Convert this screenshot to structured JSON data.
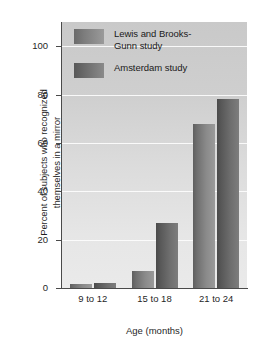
{
  "chart_data": {
    "type": "bar",
    "title": "",
    "subtitle": "",
    "xlabel": "Age (months)",
    "ylabel": "Percent of subjects who recognized\nthemselves in a mirror",
    "categories": [
      "9 to 12",
      "15 to 18",
      "21 to 24"
    ],
    "series": [
      {
        "name": "Lewis and Brooks-\nGunn study",
        "values": [
          1.5,
          7,
          68
        ]
      },
      {
        "name": "Amsterdam study",
        "values": [
          2,
          27,
          78
        ]
      }
    ],
    "ylim": [
      0,
      110
    ],
    "yticks": [
      0,
      20,
      40,
      60,
      80,
      100
    ],
    "ytick_labels": [
      "0",
      "20",
      "40",
      "60",
      "80",
      "100"
    ],
    "grid": true,
    "grid_color": "#fdfdfd",
    "legend_position": "upper-left-inside",
    "plot_background": "#d6d6d6",
    "series_colors": [
      "#8a8a8a",
      "#6e6e6e"
    ],
    "axis_color": "#4a4a4a"
  },
  "legend": {
    "entries": [
      {
        "label": "Lewis and Brooks-\nGunn study"
      },
      {
        "label": "Amsterdam study"
      }
    ]
  },
  "axes": {
    "x_title": "Age (months)",
    "y_title": "Percent of subjects who recognized\nthemselves in a mirror",
    "x_tick_labels": [
      "9 to 12",
      "15 to 18",
      "21 to 24"
    ],
    "y_tick_labels": [
      "0",
      "20",
      "40",
      "60",
      "80",
      "100"
    ]
  }
}
